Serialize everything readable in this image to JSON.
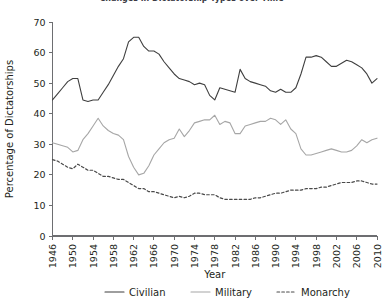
{
  "chart_data": {
    "type": "line",
    "title": "Changes in Dictatorship Types over Time",
    "xlabel": "Year",
    "ylabel": "Percentage of Dictatorships",
    "xlim": [
      1946,
      2010
    ],
    "ylim": [
      0,
      70
    ],
    "ytick_step": 10,
    "xtick_step": 4,
    "grid": false,
    "legend_position": "bottom",
    "yticks": [
      "0",
      "10",
      "20",
      "30",
      "40",
      "50",
      "60",
      "70"
    ],
    "xticks": [
      "1946",
      "1950",
      "1954",
      "1958",
      "1962",
      "1966",
      "1970",
      "1974",
      "1978",
      "1982",
      "1986",
      "1990",
      "1994",
      "1998",
      "2002",
      "2006",
      "2010"
    ],
    "x": [
      1946,
      1947,
      1948,
      1949,
      1950,
      1951,
      1952,
      1953,
      1954,
      1955,
      1956,
      1957,
      1958,
      1959,
      1960,
      1961,
      1962,
      1963,
      1964,
      1965,
      1966,
      1967,
      1968,
      1969,
      1970,
      1971,
      1972,
      1973,
      1974,
      1975,
      1976,
      1977,
      1978,
      1979,
      1980,
      1981,
      1982,
      1983,
      1984,
      1985,
      1986,
      1987,
      1988,
      1989,
      1990,
      1991,
      1992,
      1993,
      1994,
      1995,
      1996,
      1997,
      1998,
      1999,
      2000,
      2001,
      2002,
      2003,
      2004,
      2005,
      2006,
      2007,
      2008,
      2009,
      2010
    ],
    "series": [
      {
        "name": "Civilian",
        "style": "solid",
        "color": "#3f3f3f",
        "values": [
          44.5,
          46.5,
          48.5,
          50.5,
          51.5,
          51.5,
          44.5,
          44.0,
          44.5,
          44.5,
          47.0,
          49.5,
          52.5,
          55.5,
          58.0,
          63.5,
          65.0,
          65.0,
          62.0,
          60.5,
          60.5,
          59.5,
          57.0,
          55.0,
          53.0,
          51.5,
          51.0,
          50.5,
          49.5,
          50.0,
          49.5,
          46.0,
          44.5,
          48.5,
          48.0,
          47.5,
          47.0,
          54.5,
          51.5,
          50.5,
          50.0,
          49.5,
          49.0,
          47.5,
          47.0,
          48.0,
          47.0,
          47.0,
          48.5,
          53.0,
          58.5,
          58.5,
          59.0,
          58.5,
          57.0,
          55.5,
          55.5,
          56.5,
          57.5,
          57.0,
          56.0,
          55.0,
          53.0,
          50.0,
          51.5
        ]
      },
      {
        "name": "Military",
        "style": "solid",
        "color": "#a6a6a6",
        "values": [
          30.5,
          30.0,
          29.5,
          29.0,
          27.5,
          28.0,
          31.5,
          33.5,
          36.0,
          38.5,
          36.0,
          34.5,
          33.5,
          33.0,
          31.5,
          26.0,
          22.5,
          20.0,
          20.5,
          23.0,
          26.5,
          28.5,
          30.5,
          31.5,
          32.0,
          35.0,
          32.5,
          34.5,
          37.0,
          37.5,
          38.0,
          38.0,
          39.5,
          36.5,
          37.5,
          37.0,
          33.5,
          33.5,
          36.0,
          36.5,
          37.0,
          37.5,
          37.5,
          38.5,
          38.0,
          36.5,
          38.0,
          35.0,
          33.5,
          28.5,
          26.5,
          26.5,
          27.0,
          27.5,
          28.0,
          28.5,
          28.0,
          27.5,
          27.5,
          28.0,
          29.5,
          31.5,
          30.5,
          31.5,
          32.0
        ]
      },
      {
        "name": "Monarchy",
        "style": "dotted",
        "color": "#4a4a4a",
        "values": [
          25.0,
          24.5,
          23.5,
          22.5,
          22.0,
          23.5,
          22.5,
          21.5,
          21.5,
          20.5,
          19.5,
          19.5,
          19.0,
          18.5,
          18.5,
          17.5,
          16.5,
          15.5,
          15.5,
          14.5,
          14.5,
          14.0,
          13.5,
          13.0,
          12.5,
          13.0,
          12.5,
          13.0,
          14.0,
          14.0,
          13.5,
          13.5,
          13.5,
          12.5,
          12.0,
          12.0,
          12.0,
          12.0,
          12.0,
          12.0,
          12.5,
          12.5,
          13.0,
          13.5,
          14.0,
          14.0,
          14.5,
          15.0,
          15.0,
          15.0,
          15.5,
          15.5,
          15.5,
          16.0,
          16.0,
          16.5,
          17.0,
          17.5,
          17.5,
          17.5,
          18.0,
          18.0,
          17.5,
          17.0,
          17.0
        ]
      }
    ]
  },
  "legend": {
    "items": [
      {
        "label": "Civilian",
        "color": "#3f3f3f",
        "style": "solid"
      },
      {
        "label": "Military",
        "color": "#a6a6a6",
        "style": "solid"
      },
      {
        "label": "Monarchy",
        "color": "#4a4a4a",
        "style": "dotted"
      }
    ]
  }
}
